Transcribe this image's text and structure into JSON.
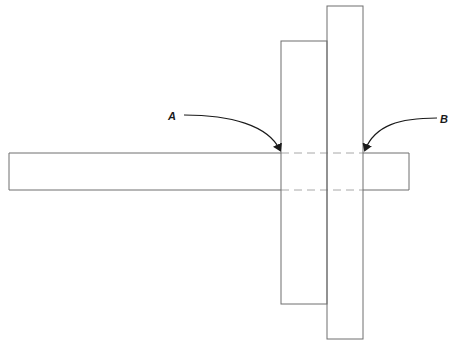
{
  "diagram": {
    "labels": {
      "a": "A",
      "b": "B"
    },
    "colors": {
      "outline": "#6e6e6e",
      "dashed": "#a8a8a8",
      "arrow": "#1a1a1a",
      "background": "#ffffff"
    },
    "shapes": {
      "horizontal_bar": {
        "x": 9,
        "y": 153,
        "w": 400,
        "h": 37
      },
      "middle_plate": {
        "x": 281,
        "y": 41,
        "w": 46,
        "h": 263
      },
      "tall_plate": {
        "x": 327,
        "y": 6,
        "w": 36,
        "h": 333
      }
    }
  }
}
